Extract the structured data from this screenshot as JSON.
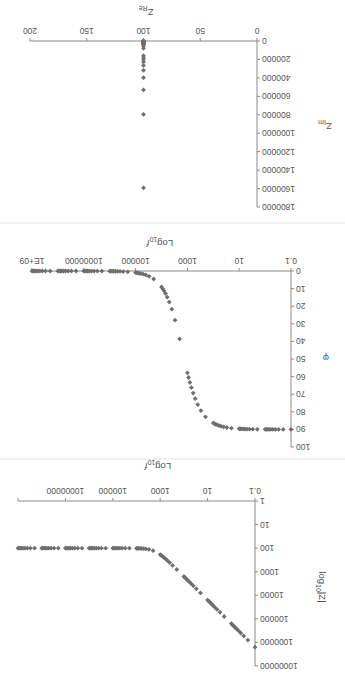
{
  "chart_data": [
    {
      "id": "magnitude",
      "type": "scatter",
      "title": "",
      "xlabel": "Log10 f",
      "ylabel": "log10 |Z|",
      "xscale": "log",
      "yscale": "log",
      "xlim": [
        0.1,
        1000000000
      ],
      "ylim": [
        1,
        10000000
      ],
      "x_tick_labels": [
        "0.1",
        "10",
        "1000",
        "100000",
        "10000000",
        ""
      ],
      "y_tick_labels": [
        "1",
        "10",
        "100",
        "1000",
        "10000",
        "100000",
        "1000000",
        "10000000"
      ],
      "grid": false,
      "legend": null,
      "marker": "diamond",
      "color": "#6e6e6e",
      "x": [
        0.1,
        0.2,
        0.3,
        0.4,
        0.5,
        0.6,
        0.7,
        0.8,
        0.9,
        1,
        2,
        3,
        4,
        5,
        6,
        7,
        8,
        9,
        10,
        20,
        30,
        40,
        50,
        60,
        70,
        80,
        90,
        100,
        200,
        300,
        400,
        500,
        600,
        700,
        800,
        900,
        1000,
        2000,
        3000,
        4000,
        5000,
        6000,
        7000,
        8000,
        9000,
        10000,
        20000,
        30000,
        40000,
        50000,
        60000,
        70000,
        80000,
        90000,
        100000,
        200000,
        300000,
        400000,
        500000,
        600000,
        700000,
        800000,
        900000,
        1000000,
        2000000,
        3000000,
        4000000,
        5000000,
        6000000,
        7000000,
        8000000,
        9000000,
        10000000,
        20000000,
        30000000,
        40000000,
        50000000,
        60000000,
        70000000,
        80000000,
        90000000,
        100000000,
        200000000,
        300000000,
        400000000,
        500000000,
        600000000,
        700000000,
        800000000,
        900000000,
        1000000000
      ],
      "values": [
        1591549,
        795775,
        530516,
        397887,
        318310,
        265258,
        227364,
        198944,
        176839,
        159155,
        79577,
        53052,
        39789,
        31831,
        26526,
        22736,
        19894,
        17684,
        15916,
        7958,
        5306,
        3980,
        3185,
        2655,
        2276,
        1992,
        1771,
        1594.7,
        802.0,
        539.9,
        410.3,
        333.6,
        283.5,
        248.4,
        222.7,
        203.1,
        188.0,
        127.8,
        113.2,
        107.6,
        104.9,
        103.5,
        102.6,
        102.0,
        101.6,
        101.3,
        100.3,
        100.1,
        100.1,
        100.1,
        100.0,
        100.0,
        100.0,
        100.0,
        100,
        100,
        100,
        100,
        100,
        100,
        100,
        100,
        100,
        100,
        100,
        100,
        100,
        100,
        100,
        100,
        100,
        100,
        100,
        100,
        100,
        100,
        100,
        100,
        100,
        100,
        100,
        100,
        100,
        100,
        100,
        100,
        100,
        100,
        100,
        100,
        100
      ]
    },
    {
      "id": "phase",
      "type": "scatter",
      "title": "",
      "xlabel": "Log10 f",
      "ylabel": "φ",
      "xscale": "log",
      "yscale": "linear",
      "xlim": [
        0.1,
        1000000000
      ],
      "ylim": [
        0,
        100
      ],
      "x_tick_labels": [
        "0.1",
        "10",
        "1000",
        "100000",
        "10000000",
        "1E+09"
      ],
      "y_tick_labels": [
        "0",
        "10",
        "20",
        "30",
        "40",
        "50",
        "60",
        "70",
        "80",
        "90",
        "100"
      ],
      "grid": false,
      "legend": null,
      "marker": "diamond",
      "color": "#6e6e6e",
      "x": [
        0.1,
        0.2,
        0.3,
        0.4,
        0.5,
        0.6,
        0.7,
        0.8,
        0.9,
        1,
        2,
        3,
        4,
        5,
        6,
        7,
        8,
        9,
        10,
        20,
        30,
        40,
        50,
        60,
        70,
        80,
        90,
        100,
        200,
        300,
        400,
        500,
        600,
        700,
        800,
        900,
        1000,
        2000,
        3000,
        4000,
        5000,
        6000,
        7000,
        8000,
        9000,
        10000,
        20000,
        30000,
        40000,
        50000,
        60000,
        70000,
        80000,
        90000,
        100000,
        200000,
        300000,
        400000,
        500000,
        600000,
        700000,
        800000,
        900000,
        1000000,
        2000000,
        3000000,
        4000000,
        5000000,
        6000000,
        7000000,
        8000000,
        9000000,
        10000000,
        20000000,
        30000000,
        40000000,
        50000000,
        60000000,
        70000000,
        80000000,
        90000000,
        100000000,
        200000000,
        300000000,
        400000000,
        500000000,
        600000000,
        700000000,
        800000000,
        900000000,
        1000000000
      ],
      "values": [
        90.0,
        90.0,
        90.0,
        89.99,
        89.98,
        89.98,
        89.97,
        89.97,
        89.97,
        89.96,
        89.93,
        89.89,
        89.86,
        89.82,
        89.78,
        89.75,
        89.71,
        89.68,
        89.64,
        89.28,
        88.92,
        88.56,
        88.2,
        87.84,
        87.48,
        87.12,
        86.76,
        86.4,
        82.84,
        79.33,
        75.89,
        72.56,
        69.34,
        66.26,
        63.31,
        60.51,
        57.86,
        38.51,
        27.94,
        21.7,
        17.66,
        14.85,
        12.81,
        11.25,
        10.03,
        9.04,
        4.55,
        3.04,
        2.28,
        1.82,
        1.52,
        1.3,
        1.14,
        1.01,
        0.91,
        0.46,
        0.3,
        0.23,
        0.18,
        0.15,
        0.13,
        0.11,
        0.1,
        0.09,
        0.05,
        0.03,
        0.02,
        0.02,
        0.02,
        0.01,
        0.01,
        0.01,
        0.01,
        0,
        0,
        0,
        0,
        0,
        0,
        0,
        0,
        0,
        0,
        0,
        0,
        0,
        0,
        0,
        0,
        0,
        0
      ]
    },
    {
      "id": "nyquist",
      "type": "scatter",
      "title": "",
      "xlabel": "Z_Re",
      "ylabel": "Z_Im",
      "xscale": "linear",
      "yscale": "linear",
      "xlim": [
        0,
        200
      ],
      "ylim": [
        0,
        1800000
      ],
      "x_tick_labels": [
        "0",
        "50",
        "100",
        "150",
        "200"
      ],
      "y_tick_labels": [
        "0",
        "200000",
        "400000",
        "600000",
        "800000",
        "1000000",
        "1200000",
        "1400000",
        "1600000",
        "1800000"
      ],
      "grid": false,
      "legend": null,
      "marker": "diamond",
      "color": "#6e6e6e",
      "x": [
        100,
        100,
        100,
        100,
        100,
        100,
        100,
        100,
        100,
        100,
        100,
        100,
        100,
        100,
        100,
        100,
        100,
        100,
        100,
        100,
        100,
        100,
        100,
        100,
        100,
        100,
        100,
        100
      ],
      "values": [
        1591549,
        795775,
        530516,
        397887,
        318310,
        265258,
        227364,
        198944,
        176839,
        159155,
        79577,
        53052,
        39789,
        31831,
        26526,
        22736,
        19894,
        17684,
        15916,
        7958,
        5306,
        3980,
        3185,
        2655,
        2276,
        1992,
        1771,
        1592
      ]
    }
  ],
  "labels": {
    "mag_xlabel_main": "Log",
    "mag_xlabel_sub": "10",
    "mag_xlabel_tail": "f",
    "mag_ylabel_main": "log",
    "mag_ylabel_sub": "10",
    "mag_ylabel_tail": "|Z|",
    "phase_xlabel_main": "Log",
    "phase_xlabel_sub": "10",
    "phase_xlabel_tail": "f",
    "phase_ylabel": "φ",
    "nyq_xlabel_main": "Z",
    "nyq_xlabel_sub": "Re",
    "nyq_ylabel_main": "Z",
    "nyq_ylabel_sub": "Im"
  }
}
